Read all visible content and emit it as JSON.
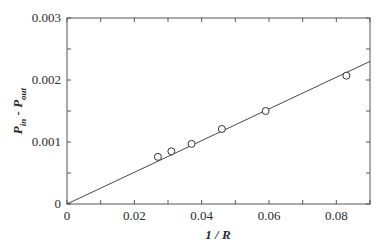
{
  "chart_data": {
    "type": "scatter",
    "title": "",
    "xlabel": "1 / R",
    "ylabel": "P_in - P_out",
    "xlim": [
      0,
      0.09
    ],
    "ylim": [
      0,
      0.003
    ],
    "x_ticks": [
      "0",
      "0.02",
      "0.04",
      "0.06",
      "0.08"
    ],
    "y_ticks": [
      "0",
      "0.001",
      "0.002",
      "0.003"
    ],
    "grid": false,
    "legend": null,
    "series": [
      {
        "name": "measured",
        "marker": "open-circle",
        "x": [
          0.027,
          0.031,
          0.037,
          0.046,
          0.059,
          0.083
        ],
        "y": [
          0.00076,
          0.00085,
          0.00097,
          0.00121,
          0.0015,
          0.00207
        ]
      },
      {
        "name": "linear fit",
        "style": "line",
        "x": [
          0,
          0.09
        ],
        "y": [
          0,
          0.0023
        ]
      }
    ]
  },
  "labels": {
    "xlabel": "1 / R",
    "ylabel_main": "P",
    "ylabel_sub_in": "in",
    "ylabel_mid": " - P",
    "ylabel_sub_out": "out"
  },
  "colors": {
    "axis": "#555555",
    "line": "#333333",
    "marker": "#333333"
  }
}
